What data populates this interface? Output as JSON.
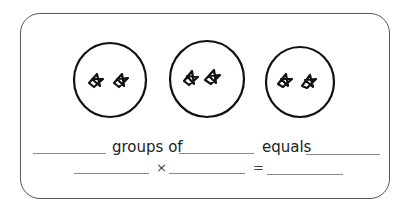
{
  "worksheet": {
    "groups": [
      {
        "stars": 2
      },
      {
        "stars": 2
      },
      {
        "stars": 2
      }
    ],
    "sentence": {
      "groups_of_label": "groups of",
      "equals_label": "equals",
      "blank_1": "",
      "blank_2": "",
      "blank_3": ""
    },
    "equation": {
      "times_symbol": "×",
      "equals_symbol": "=",
      "blank_1": "",
      "blank_2": "",
      "blank_3": ""
    }
  }
}
